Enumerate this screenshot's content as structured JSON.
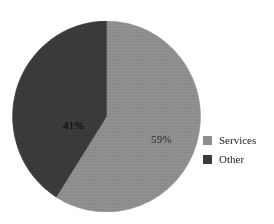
{
  "background_color": "#ffffff",
  "chart_data": {
    "type": "pie",
    "title": "",
    "subtitle": "",
    "xlabel": "",
    "ylabel": "",
    "grid": false,
    "legend_position": "right",
    "start_angle_clock_position": "12 o'clock",
    "direction": "clockwise",
    "categories": [
      "Services",
      "Other"
    ],
    "values": [
      59,
      41
    ],
    "value_unit": "%",
    "data_labels": [
      "59%",
      "41%"
    ],
    "colors": [
      "#8e8e8e",
      "#3a3a3a"
    ],
    "slices": [
      {
        "name": "Services",
        "value": 59,
        "label": "59%",
        "color": "#8e8e8e",
        "legend_label": "Services"
      },
      {
        "name": "Other",
        "value": 41,
        "label": "41%",
        "color": "#3a3a3a",
        "legend_label": "Other"
      }
    ],
    "geometry": {
      "center_x": 106,
      "center_y": 116,
      "radius": 94
    }
  },
  "legend": {
    "items": [
      {
        "label": "Services",
        "color": "#8e8e8e",
        "swatch_name": "legend-swatch-services"
      },
      {
        "label": "Other",
        "color": "#3a3a3a",
        "swatch_name": "legend-swatch-other"
      }
    ]
  },
  "labels": {
    "services_pct": "59%",
    "other_pct": "41%"
  }
}
